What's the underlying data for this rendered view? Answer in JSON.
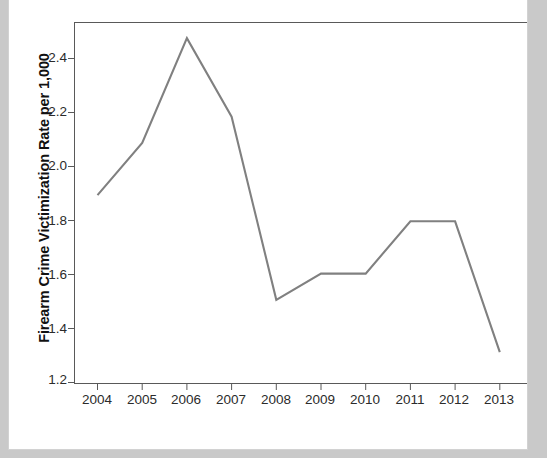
{
  "chart_data": {
    "type": "line",
    "title": "",
    "xlabel": "Year",
    "ylabel": "Firearm Crime Victimization Rate per 1,000",
    "categories": [
      "2004",
      "2005",
      "2006",
      "2007",
      "2008",
      "2009",
      "2010",
      "2011",
      "2012",
      "2013"
    ],
    "values": [
      1.9,
      2.1,
      2.5,
      2.2,
      1.5,
      1.6,
      1.6,
      1.8,
      1.8,
      1.3
    ],
    "series": [
      {
        "name": "Firearm Crime Victimization Rate per 1,000",
        "values": [
          1.9,
          2.1,
          2.5,
          2.2,
          1.5,
          1.6,
          1.6,
          1.8,
          1.8,
          1.3
        ]
      }
    ],
    "ylim": [
      1.18,
      2.56
    ],
    "xlim": [
      "2004",
      "2013"
    ],
    "ytick_labels": [
      "1.2",
      "1.4",
      "1.6",
      "1.8",
      "2.0",
      "2.2",
      "2.4"
    ],
    "ytick_values": [
      1.2,
      1.4,
      1.6,
      1.8,
      2.0,
      2.2,
      2.4
    ],
    "xtick_labels": [
      "2004",
      "2005",
      "2006",
      "2007",
      "2008",
      "2009",
      "2010",
      "2011",
      "2012",
      "2013"
    ],
    "grid": false,
    "legend": null,
    "legend_position": "none",
    "line_color": "#808080",
    "frame_color": "#595959",
    "background_color": "#ffffff",
    "page_background_color": "#c9c9c9"
  },
  "figure": {
    "title": "",
    "y_axis_title": "Firearm Crime Victimization Rate per 1,000",
    "x_axis_title": "Year"
  }
}
